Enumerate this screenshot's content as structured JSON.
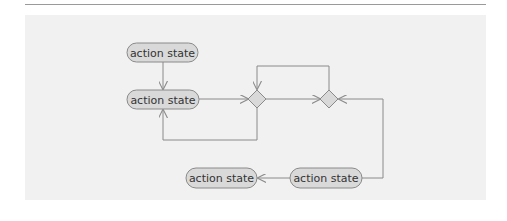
{
  "diagram": {
    "type": "activity-diagram",
    "colors": {
      "panel_bg": "#f1f1f1",
      "node_fill": "#d9d9d9",
      "node_stroke": "#8a8a8a",
      "edge": "#8a8a8a",
      "text": "#333333"
    },
    "nodes": [
      {
        "id": "a1",
        "kind": "action",
        "label": "action state"
      },
      {
        "id": "a2",
        "kind": "action",
        "label": "action state"
      },
      {
        "id": "d1",
        "kind": "decision",
        "label": ""
      },
      {
        "id": "d2",
        "kind": "decision",
        "label": ""
      },
      {
        "id": "a3",
        "kind": "action",
        "label": "action state"
      },
      {
        "id": "a4",
        "kind": "action",
        "label": "action state"
      }
    ],
    "edges": [
      {
        "from": "a1",
        "to": "a2"
      },
      {
        "from": "a2",
        "to": "d1"
      },
      {
        "from": "d1",
        "to": "d2"
      },
      {
        "from": "d1",
        "to": "a2"
      },
      {
        "from": "d2",
        "to": "d1"
      },
      {
        "from": "a3",
        "to": "d2"
      },
      {
        "from": "a3",
        "to": "a4"
      }
    ]
  }
}
